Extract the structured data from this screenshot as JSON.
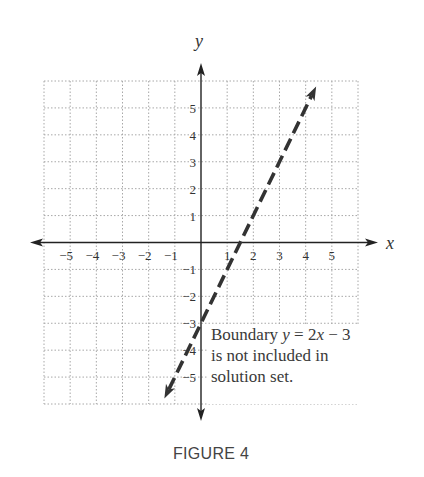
{
  "figure": {
    "caption": "FIGURE 4"
  },
  "colors": {
    "axis": "#222222",
    "grid": "#a8a8a8",
    "boundary_line": "#333333",
    "text": "#333333"
  },
  "chart_data": {
    "type": "line",
    "title": "",
    "xlabel": "x",
    "ylabel": "y",
    "xlim": [
      -6,
      6
    ],
    "ylim": [
      -6,
      6
    ],
    "grid": true,
    "x_ticks": [
      -5,
      -4,
      -3,
      -2,
      -1,
      1,
      2,
      3,
      4,
      5
    ],
    "y_ticks": [
      -5,
      -4,
      -3,
      -2,
      -1,
      1,
      2,
      3,
      4,
      5
    ],
    "x_tick_labels": [
      "−5",
      "−4",
      "−3",
      "−2",
      "−1",
      "1",
      "2",
      "3",
      "4",
      "5"
    ],
    "y_tick_labels": [
      "−5",
      "−4",
      "−3",
      "−2",
      "−1",
      "1",
      "2",
      "3",
      "4",
      "5"
    ],
    "series": [
      {
        "name": "Boundary y = 2x − 3",
        "equation": "y = 2x - 3",
        "style": "dashed",
        "arrows": "both",
        "x": [
          -1.4,
          4.4
        ],
        "y": [
          -5.8,
          5.8
        ]
      }
    ],
    "annotations": [
      {
        "lines": [
          "Boundary y = 2x − 3",
          "is not included in",
          "solution set."
        ],
        "x": 0.35,
        "y": -3.6
      }
    ]
  },
  "annotation": {
    "line1_prefix": "Boundary ",
    "line1_math": "y",
    "line1_eq": " = 2",
    "line1_math2": "x",
    "line1_suffix": " − 3",
    "line2": "is not included in",
    "line3": "solution set."
  }
}
